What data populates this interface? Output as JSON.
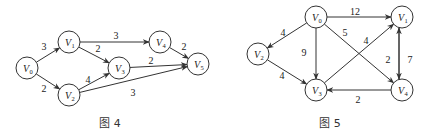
{
  "figures": [
    {
      "caption": "图 4",
      "caption_pos": [
        110,
        127
      ],
      "nodes": [
        {
          "id": "V0",
          "sub": "0",
          "x": 27,
          "y": 68
        },
        {
          "id": "V1",
          "sub": "1",
          "x": 69,
          "y": 42
        },
        {
          "id": "V2",
          "sub": "2",
          "x": 69,
          "y": 95
        },
        {
          "id": "V3",
          "sub": "3",
          "x": 119,
          "y": 68
        },
        {
          "id": "V4",
          "sub": "4",
          "x": 160,
          "y": 42
        },
        {
          "id": "V5",
          "sub": "5",
          "x": 198,
          "y": 64
        }
      ],
      "edges": [
        {
          "from": "V0",
          "to": "V1",
          "w": "3",
          "lx": 44,
          "ly": 50
        },
        {
          "from": "V0",
          "to": "V2",
          "w": "2",
          "lx": 44,
          "ly": 92
        },
        {
          "from": "V1",
          "to": "V4",
          "w": "3",
          "lx": 116,
          "ly": 39
        },
        {
          "from": "V1",
          "to": "V3",
          "w": "2",
          "lx": 98,
          "ly": 52
        },
        {
          "from": "V2",
          "to": "V3",
          "w": "4",
          "lx": 88,
          "ly": 83
        },
        {
          "from": "V2",
          "to": "V5",
          "w": "3",
          "lx": 133,
          "ly": 96
        },
        {
          "from": "V3",
          "to": "V5",
          "w": "2",
          "lx": 151,
          "ly": 64
        },
        {
          "from": "V4",
          "to": "V5",
          "w": "2",
          "lx": 184,
          "ly": 50
        }
      ]
    },
    {
      "caption": "图 5",
      "caption_pos": [
        330,
        127
      ],
      "nodes": [
        {
          "id": "V0",
          "sub": "0",
          "x": 316,
          "y": 17
        },
        {
          "id": "V1",
          "sub": "1",
          "x": 402,
          "y": 17
        },
        {
          "id": "V2",
          "sub": "2",
          "x": 258,
          "y": 54
        },
        {
          "id": "V3",
          "sub": "3",
          "x": 316,
          "y": 90
        },
        {
          "id": "V4",
          "sub": "4",
          "x": 402,
          "y": 90
        }
      ],
      "edges": [
        {
          "from": "V0",
          "to": "V1",
          "w": "12",
          "lx": 355,
          "ly": 15
        },
        {
          "from": "V0",
          "to": "V2",
          "w": "4",
          "lx": 283,
          "ly": 36
        },
        {
          "from": "V0",
          "to": "V3",
          "w": "9",
          "lx": 304,
          "ly": 56
        },
        {
          "from": "V0",
          "to": "V4",
          "w": "5",
          "lx": 345,
          "ly": 36
        },
        {
          "from": "V2",
          "to": "V3",
          "w": "4",
          "lx": 282,
          "ly": 79
        },
        {
          "from": "V3",
          "to": "V1",
          "w": "4",
          "lx": 366,
          "ly": 44
        },
        {
          "from": "V4",
          "to": "V1",
          "w": "2",
          "lx": 388,
          "ly": 63,
          "offset": -3
        },
        {
          "from": "V1",
          "to": "V4",
          "w": "7",
          "lx": 410,
          "ly": 63,
          "offset": 3
        },
        {
          "from": "V4",
          "to": "V3",
          "w": "2",
          "lx": 358,
          "ly": 103
        }
      ]
    }
  ],
  "style": {
    "stroke": "#333333",
    "background": "#ffffff",
    "node_radius": 11
  }
}
